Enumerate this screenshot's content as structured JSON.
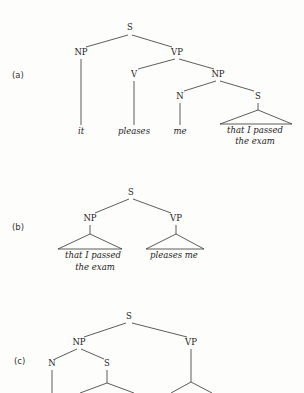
{
  "header_fragment": "",
  "trees": [
    {
      "label": "(a)",
      "nodes": {
        "S": "S",
        "NP": "NP",
        "VP": "VP",
        "V": "V",
        "NP2": "NP",
        "N": "N",
        "S2": "S"
      },
      "words": {
        "it": "it",
        "pleases": "pleases",
        "me": "me",
        "clause_line1": "that I passed",
        "clause_line2": "the exam"
      }
    },
    {
      "label": "(b)",
      "nodes": {
        "S": "S",
        "NP": "NP",
        "VP": "VP"
      },
      "words": {
        "clause_line1": "that I passed",
        "clause_line2": "the exam",
        "vp": "pleases me"
      }
    },
    {
      "label": "(c)",
      "nodes": {
        "S": "S",
        "NP": "NP",
        "VP": "VP",
        "N": "N",
        "S2": "S"
      },
      "words": {}
    }
  ]
}
